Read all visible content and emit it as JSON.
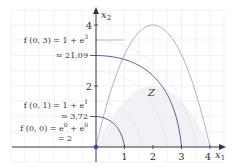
{
  "diagram": {
    "axes": {
      "x_label": "x",
      "x_label_sub": "1",
      "y_label": "x",
      "y_label_sub": "2",
      "x_ticks": [
        "1",
        "2",
        "3",
        "4"
      ],
      "y_ticks": [
        "2",
        "4"
      ]
    },
    "region_label": "Z",
    "annotations": [
      {
        "line1_lhs": "f (0, 3) = 1 + e",
        "line1_exp": "3",
        "line2": "≈ 21,09"
      },
      {
        "line1_lhs": "f (0, 1) = 1 + e",
        "line1_exp": "1",
        "line2": "≈ 3,72"
      },
      {
        "line1_lhs": "f (0, 0) = e",
        "line1_exp": "0",
        "line1_mid": " + e",
        "line1_exp2": "0",
        "line2": "= 2"
      }
    ],
    "colors": {
      "grid": "#e6e6ee",
      "axis": "#333344",
      "region_fill": "#eeeef4",
      "region_border": "#a8a8bc",
      "level_curve": "#5a6494",
      "level_curve_light": "#c8c8d8",
      "origin_dot": "#3a4a9a"
    }
  }
}
